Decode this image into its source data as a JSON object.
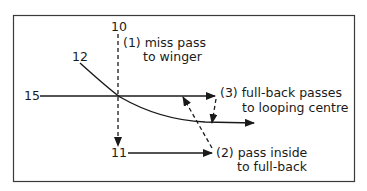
{
  "diagram": {
    "title": "",
    "players": {
      "p10": "10",
      "p12": "12",
      "p15": "15",
      "p11": "11"
    },
    "annotations": {
      "step1": {
        "line1": "(1) miss pass",
        "line2": "to winger"
      },
      "step2": {
        "line1": "(2) pass inside",
        "line2": "to full-back"
      },
      "step3": {
        "line1": "(3) full-back passes",
        "line2": "to looping centre"
      }
    },
    "colors": {
      "ink": "#1a1a1a",
      "frame": "#3a3a3a",
      "background": "#ffffff"
    }
  }
}
